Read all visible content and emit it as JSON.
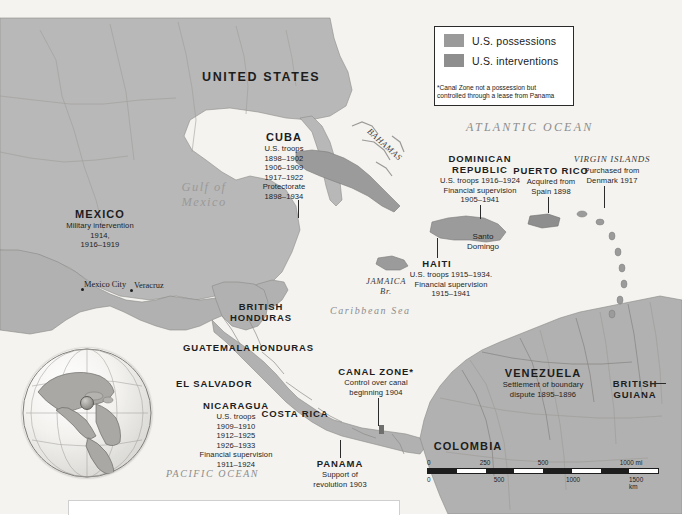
{
  "map": {
    "title": "U.S. Possessions and Interventions in the Caribbean and Central America",
    "colors": {
      "possessions": "#9a9a9a",
      "interventions": "#8e8e8e",
      "land": "#b9b9b9",
      "water": "#f2f1ee",
      "text": "#1d1d1d",
      "ocean_text": "#8d8d8d"
    }
  },
  "legend": {
    "items": [
      {
        "label": "U.S. possessions",
        "color": "#9a9a9a"
      },
      {
        "label": "U.S. interventions",
        "color": "#8e8e8e"
      }
    ],
    "footnote": "*Canal Zone not a possession but controlled through a lease from Panama"
  },
  "oceans": [
    {
      "name": "ATLANTIC OCEAN",
      "id": "atlantic"
    },
    {
      "name": "PACIFIC OCEAN",
      "id": "pacific"
    },
    {
      "name": "Caribbean Sea",
      "id": "caribbean"
    },
    {
      "name": "Gulf of",
      "name2": "Mexico",
      "id": "gulf"
    }
  ],
  "countries": {
    "united_states": {
      "name": "UNITED STATES"
    },
    "mexico": {
      "name": "MEXICO",
      "notes": [
        "Military intervention",
        "1914,",
        "1916–1919"
      ]
    },
    "cuba": {
      "name": "CUBA",
      "notes": [
        "U.S. troops",
        "1898–1902",
        "1906–1909",
        "1917–1922",
        "Protectorate",
        "1898–1934"
      ]
    },
    "dominican_republic": {
      "name": "DOMINICAN",
      "name2": "REPUBLIC",
      "notes": [
        "U.S. troops 1916–1924",
        "Financial supervision",
        "1905–1941"
      ]
    },
    "puerto_rico": {
      "name": "PUERTO RICO",
      "notes": [
        "Acquired from",
        "Spain 1898"
      ]
    },
    "virgin_islands": {
      "name": "VIRGIN ISLANDS",
      "notes": [
        "Purchased from",
        "Denmark 1917"
      ]
    },
    "haiti": {
      "name": "HAITI",
      "notes": [
        "U.S. troops 1915–1934.",
        "Financial supervision",
        "1915–1941"
      ]
    },
    "jamaica": {
      "name": "JAMAICA",
      "sub": "Br."
    },
    "bahamas": {
      "name": "BAHAMAS"
    },
    "british_honduras": {
      "name": "BRITISH",
      "name2": "HONDURAS"
    },
    "guatemala": {
      "name": "GUATEMALA"
    },
    "honduras": {
      "name": "HONDURAS"
    },
    "el_salvador": {
      "name": "EL SALVADOR"
    },
    "nicaragua": {
      "name": "NICARAGUA",
      "notes": [
        "U.S. troops",
        "1909–1910",
        "1912–1925",
        "1926–1933",
        "Financial supervision",
        "1911–1924"
      ]
    },
    "costa_rica": {
      "name": "COSTA RICA"
    },
    "canal_zone": {
      "name": "CANAL ZONE*",
      "notes": [
        "Control over canal",
        "beginning 1904"
      ]
    },
    "panama": {
      "name": "PANAMA",
      "notes": [
        "Support of",
        "revolution 1903"
      ]
    },
    "colombia": {
      "name": "COLOMBIA"
    },
    "venezuela": {
      "name": "VENEZUELA",
      "notes": [
        "Settlement of boundary",
        "dispute 1895–1896"
      ]
    },
    "british_guiana": {
      "name": "BRITISH",
      "name2": "GUIANA"
    },
    "santo_domingo": {
      "name": "Santo",
      "name2": "Domingo"
    }
  },
  "cities": [
    {
      "name": "Mexico City"
    },
    {
      "name": "Veracruz"
    }
  ],
  "scale": {
    "miles": {
      "ticks": [
        "0",
        "250",
        "500",
        "1000 mi"
      ]
    },
    "km": {
      "ticks": [
        "0",
        "500",
        "1000",
        "1500 km"
      ]
    }
  }
}
